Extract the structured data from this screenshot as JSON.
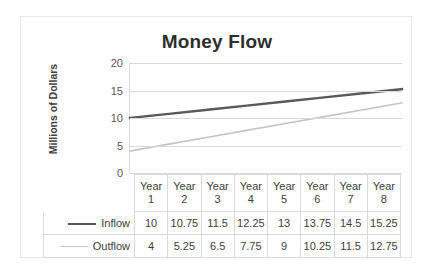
{
  "chart_data": {
    "type": "line",
    "title": "Money Flow",
    "xlabel": "",
    "ylabel": "Millions of Dollars",
    "categories": [
      "Year 1",
      "Year 2",
      "Year 3",
      "Year 4",
      "Year 5",
      "Year 6",
      "Year 7",
      "Year 8"
    ],
    "category_line1": [
      "Year",
      "Year",
      "Year",
      "Year",
      "Year",
      "Year",
      "Year",
      "Year"
    ],
    "category_line2": [
      "1",
      "2",
      "3",
      "4",
      "5",
      "6",
      "7",
      "8"
    ],
    "series": [
      {
        "name": "Inflow",
        "color": "#595959",
        "values": [
          10,
          10.75,
          11.5,
          12.25,
          13,
          13.75,
          14.5,
          15.25
        ],
        "labels": [
          "10",
          "10.75",
          "11.5",
          "12.25",
          "13",
          "13.75",
          "14.5",
          "15.25"
        ]
      },
      {
        "name": "Outflow",
        "color": "#c4c4c4",
        "values": [
          4,
          5.25,
          6.5,
          7.75,
          9,
          10.25,
          11.5,
          12.75
        ],
        "labels": [
          "4",
          "5.25",
          "6.5",
          "7.75",
          "9",
          "10.25",
          "11.5",
          "12.75"
        ]
      }
    ],
    "ylim": [
      0,
      20
    ],
    "yticks": [
      0,
      5,
      10,
      15,
      20
    ],
    "ytick_labels": [
      "0",
      "5",
      "10",
      "15",
      "20"
    ],
    "grid": true,
    "legend_position": "data-table-left",
    "data_table_visible": true
  }
}
